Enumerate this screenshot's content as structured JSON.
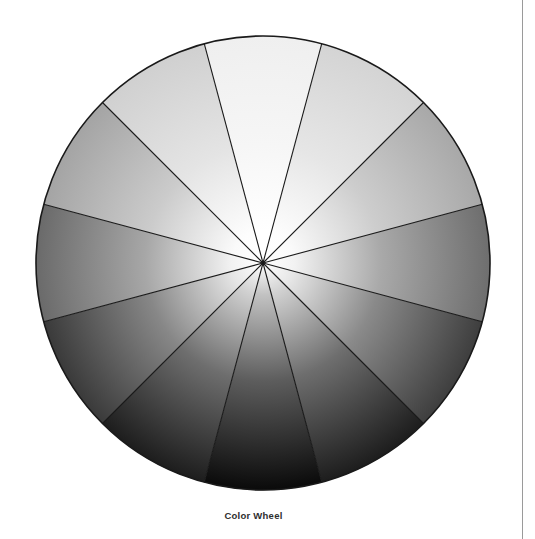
{
  "page": {
    "background_color": "#ffffff",
    "rule_color": "#9a9a9a"
  },
  "figure": {
    "caption": "Color Wheel",
    "caption_color": "#2e2e2e"
  },
  "chart_data": {
    "type": "pie",
    "title": "Color Wheel",
    "xlabel": "",
    "ylabel": "",
    "legend_position": "none",
    "grid": false,
    "center_x": 263,
    "center_y": 263,
    "radius": 227,
    "segment_count": 12,
    "segment_angle_deg": 30,
    "start_angle_deg": -105,
    "outline_color": "#1a1a1a",
    "spoke_color": "#1a1a1a",
    "center_highlight_color": "#ffffff",
    "categories": [
      "Segment 1",
      "Segment 2",
      "Segment 3",
      "Segment 4",
      "Segment 5",
      "Segment 6",
      "Segment 7",
      "Segment 8",
      "Segment 9",
      "Segment 10",
      "Segment 11",
      "Segment 12"
    ],
    "values": [
      30,
      30,
      30,
      30,
      30,
      30,
      30,
      30,
      30,
      30,
      30,
      30
    ],
    "segments": [
      {
        "index": 0,
        "start_deg": -105,
        "end_deg": -75,
        "rim_color": "#efefef",
        "inner_color": "#ffffff"
      },
      {
        "index": 1,
        "start_deg": -75,
        "end_deg": -45,
        "rim_color": "#d4d4d4",
        "inner_color": "#fdfdfd"
      },
      {
        "index": 2,
        "start_deg": -45,
        "end_deg": -15,
        "rim_color": "#a8a8a8",
        "inner_color": "#fafafa"
      },
      {
        "index": 3,
        "start_deg": -15,
        "end_deg": 15,
        "rim_color": "#6e6e6e",
        "inner_color": "#f2f2f2"
      },
      {
        "index": 4,
        "start_deg": 15,
        "end_deg": 45,
        "rim_color": "#3e3e3e",
        "inner_color": "#e6e6e6"
      },
      {
        "index": 5,
        "start_deg": 45,
        "end_deg": 75,
        "rim_color": "#1d1d1d",
        "inner_color": "#d2d2d2"
      },
      {
        "index": 6,
        "start_deg": 75,
        "end_deg": 105,
        "rim_color": "#0a0a0a",
        "inner_color": "#c2c2c2"
      },
      {
        "index": 7,
        "start_deg": 105,
        "end_deg": 135,
        "rim_color": "#1d1d1d",
        "inner_color": "#d2d2d2"
      },
      {
        "index": 8,
        "start_deg": 135,
        "end_deg": 165,
        "rim_color": "#3a3a3a",
        "inner_color": "#e6e6e6"
      },
      {
        "index": 9,
        "start_deg": 165,
        "end_deg": 195,
        "rim_color": "#6a6a6a",
        "inner_color": "#f2f2f2"
      },
      {
        "index": 10,
        "start_deg": 195,
        "end_deg": 225,
        "rim_color": "#a4a4a4",
        "inner_color": "#fafafa"
      },
      {
        "index": 11,
        "start_deg": 225,
        "end_deg": 255,
        "rim_color": "#d0d0d0",
        "inner_color": "#fdfdfd"
      }
    ]
  }
}
